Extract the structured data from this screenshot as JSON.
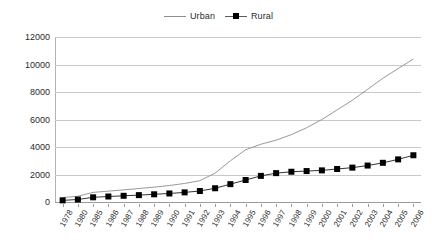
{
  "legend": {
    "position": "top-center",
    "entries": [
      {
        "label": "Urban",
        "marker": "line",
        "color": "#8d8d8d"
      },
      {
        "label": "Rural",
        "marker": "square-line",
        "color": "#000000"
      }
    ]
  },
  "axes": {
    "y": {
      "label": "",
      "min": 0,
      "max": 12000,
      "step": 2000,
      "ticks": [
        "0",
        "2000",
        "4000",
        "6000",
        "8000",
        "10000",
        "12000"
      ]
    },
    "x": {
      "label": "",
      "ticks": [
        "1978",
        "1980",
        "1985",
        "1986",
        "1987",
        "1988",
        "1989",
        "1990",
        "1991",
        "1992",
        "1993",
        "1994",
        "1995",
        "1996",
        "1997",
        "1998",
        "1999",
        "2000",
        "2001",
        "2002",
        "2003",
        "2004",
        "2005",
        "2006"
      ]
    }
  },
  "chart_data": {
    "type": "line",
    "title": "",
    "subtitle": "",
    "xlabel": "",
    "ylabel": "",
    "ylim": [
      0,
      12000
    ],
    "grid": true,
    "legend_position": "top-center",
    "categories": [
      "1978",
      "1980",
      "1985",
      "1986",
      "1987",
      "1988",
      "1989",
      "1990",
      "1991",
      "1992",
      "1993",
      "1994",
      "1995",
      "1996",
      "1997",
      "1998",
      "1999",
      "2000",
      "2001",
      "2002",
      "2003",
      "2004",
      "2005",
      "2006"
    ],
    "series": [
      {
        "name": "Urban",
        "style": "line",
        "color": "#8d8d8d",
        "values": [
          320,
          420,
          700,
          790,
          880,
          980,
          1080,
          1200,
          1350,
          1550,
          2100,
          3000,
          3800,
          4200,
          4500,
          4900,
          5400,
          6000,
          6700,
          7400,
          8200,
          9000,
          9700,
          10400
        ]
      },
      {
        "name": "Rural",
        "style": "line-marker-square",
        "color": "#000000",
        "values": [
          120,
          180,
          340,
          400,
          450,
          500,
          560,
          620,
          700,
          800,
          1000,
          1300,
          1600,
          1900,
          2100,
          2200,
          2250,
          2300,
          2400,
          2500,
          2650,
          2850,
          3100,
          3400
        ]
      }
    ]
  }
}
